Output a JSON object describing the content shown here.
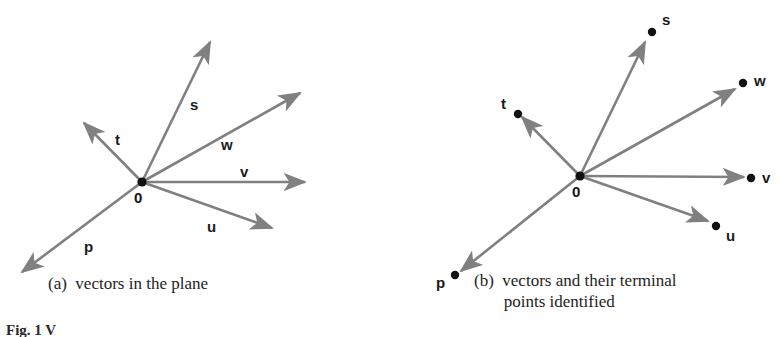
{
  "figure": {
    "background_color": "#ffffff",
    "arrow_color": "#808080",
    "dot_color": "#111111",
    "label_color": "#1a1a1a",
    "width": 781,
    "height": 337,
    "caption": "Fig. 1  V"
  },
  "panels": [
    {
      "id": "a",
      "caption": "(a)  vectors in the plane",
      "origin_label": "0",
      "origin": {
        "x": 142,
        "y": 182
      },
      "vectors": [
        {
          "name": "s",
          "label": "s",
          "tip": {
            "x": 210,
            "y": 42
          },
          "label_pos": {
            "x": 190,
            "y": 97
          }
        },
        {
          "name": "w",
          "label": "w",
          "tip": {
            "x": 300,
            "y": 93
          },
          "label_pos": {
            "x": 221,
            "y": 137
          }
        },
        {
          "name": "v",
          "label": "v",
          "tip": {
            "x": 305,
            "y": 182
          },
          "label_pos": {
            "x": 240,
            "y": 164
          }
        },
        {
          "name": "u",
          "label": "u",
          "tip": {
            "x": 272,
            "y": 228
          },
          "label_pos": {
            "x": 207,
            "y": 219
          }
        },
        {
          "name": "t",
          "label": "t",
          "tip": {
            "x": 84,
            "y": 123
          },
          "label_pos": {
            "x": 115,
            "y": 132
          }
        },
        {
          "name": "p",
          "label": "p",
          "tip": {
            "x": 22,
            "y": 272
          },
          "label_pos": {
            "x": 84,
            "y": 239
          }
        }
      ]
    },
    {
      "id": "b",
      "caption": "(b)  vectors and their terminal\n       points identified",
      "origin_label": "0",
      "origin": {
        "x": 580,
        "y": 176
      },
      "vectors": [
        {
          "name": "s",
          "label": "s",
          "tip": {
            "x": 645,
            "y": 42
          },
          "dot": {
            "x": 652,
            "y": 32
          },
          "label_pos": {
            "x": 662,
            "y": 12
          }
        },
        {
          "name": "w",
          "label": "w",
          "tip": {
            "x": 735,
            "y": 89
          },
          "dot": {
            "x": 743,
            "y": 83
          },
          "label_pos": {
            "x": 754,
            "y": 73
          }
        },
        {
          "name": "v",
          "label": "v",
          "tip": {
            "x": 744,
            "y": 177
          },
          "dot": {
            "x": 751,
            "y": 178
          },
          "label_pos": {
            "x": 762,
            "y": 170
          }
        },
        {
          "name": "u",
          "label": "u",
          "tip": {
            "x": 708,
            "y": 221
          },
          "dot": {
            "x": 716,
            "y": 226
          },
          "label_pos": {
            "x": 726,
            "y": 228
          }
        },
        {
          "name": "t",
          "label": "t",
          "tip": {
            "x": 522,
            "y": 117
          },
          "dot": {
            "x": 518,
            "y": 114
          },
          "label_pos": {
            "x": 501,
            "y": 96
          }
        },
        {
          "name": "p",
          "label": "p",
          "tip": {
            "x": 461,
            "y": 271
          },
          "dot": {
            "x": 455,
            "y": 275
          },
          "label_pos": {
            "x": 436,
            "y": 275
          }
        }
      ]
    }
  ],
  "captions": {
    "panel_a": {
      "x": 48,
      "y": 273
    },
    "panel_b": {
      "x": 474,
      "y": 270
    },
    "figure": {
      "x": 6,
      "y": 322
    }
  }
}
